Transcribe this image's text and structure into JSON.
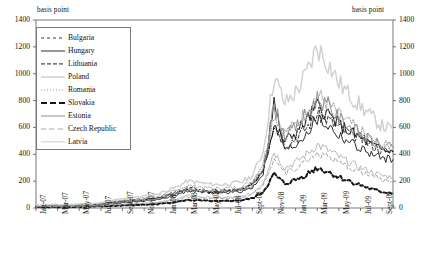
{
  "axis": {
    "unit_left": "basis point",
    "unit_right": "basis point",
    "y_ticks": [
      "1400",
      "1200",
      "1000",
      "800",
      "600",
      "400",
      "200",
      "0"
    ],
    "y_ticks_right": [
      "1400",
      "1200",
      "1000",
      "800",
      "600",
      "400",
      "200",
      "0"
    ],
    "x_ticks": [
      "Jan-07",
      "Mar-07",
      "May-07",
      "Jul-07",
      "Sept-07",
      "Nov-07",
      "Jan-08",
      "Mar-08",
      "May-08",
      "Jul-08",
      "Sept-08",
      "Nov-08",
      "Jan-09",
      "Mar-09",
      "May-09",
      "Jul-09",
      "Sept-09"
    ]
  },
  "legend": {
    "items": [
      {
        "label": "Bulgaria",
        "style": "dashed-long",
        "color": "#3a3a3a",
        "width": 1.0
      },
      {
        "label": "Hungary",
        "style": "solid",
        "color": "#2b2b2b",
        "width": 1.0
      },
      {
        "label": "Lithuania",
        "style": "dashdot",
        "color": "#1e1e1e",
        "width": 1.2
      },
      {
        "label": "Poland",
        "style": "solid",
        "color": "#b9b9b9",
        "width": 1.0
      },
      {
        "label": "Romania",
        "style": "dotted",
        "color": "#9a9a9a",
        "width": 1.0
      },
      {
        "label": "Slovakia",
        "style": "dashed-bold",
        "color": "#151515",
        "width": 2.0
      },
      {
        "label": "Estonia",
        "style": "solid",
        "color": "#8f8f8f",
        "width": 1.0
      },
      {
        "label": "Czech Republic",
        "style": "dashed-gray",
        "color": "#a8a8a8",
        "width": 1.0
      },
      {
        "label": "Latvia",
        "style": "solid",
        "color": "#cfcfcf",
        "width": 1.4
      }
    ]
  },
  "chart_data": {
    "type": "line",
    "title": "",
    "xlabel": "",
    "ylabel": "basis point",
    "ylim": [
      0,
      1400
    ],
    "grid": false,
    "legend_position": "top-left-inside",
    "x": [
      "Jan-07",
      "Feb-07",
      "Mar-07",
      "Apr-07",
      "May-07",
      "Jun-07",
      "Jul-07",
      "Aug-07",
      "Sept-07",
      "Oct-07",
      "Nov-07",
      "Dec-07",
      "Jan-08",
      "Feb-08",
      "Mar-08",
      "Apr-08",
      "May-08",
      "Jun-08",
      "Jul-08",
      "Aug-08",
      "Sept-08",
      "Oct-08",
      "Nov-08",
      "Dec-08",
      "Jan-09",
      "Feb-09",
      "Mar-09",
      "Apr-09",
      "May-09",
      "Jun-09",
      "Jul-09",
      "Aug-09",
      "Sept-09",
      "Oct-09"
    ],
    "series": [
      {
        "name": "Bulgaria",
        "values": [
          18,
          20,
          22,
          20,
          24,
          26,
          30,
          44,
          52,
          60,
          66,
          74,
          96,
          118,
          150,
          140,
          130,
          128,
          134,
          142,
          176,
          300,
          640,
          470,
          520,
          600,
          700,
          660,
          600,
          560,
          520,
          470,
          430,
          420
        ]
      },
      {
        "name": "Hungary",
        "values": [
          14,
          15,
          16,
          16,
          18,
          20,
          24,
          34,
          40,
          46,
          52,
          58,
          76,
          96,
          128,
          120,
          112,
          110,
          116,
          124,
          150,
          260,
          780,
          420,
          470,
          560,
          660,
          610,
          540,
          490,
          440,
          400,
          370,
          360
        ]
      },
      {
        "name": "Lithuania",
        "values": [
          16,
          17,
          18,
          18,
          20,
          22,
          26,
          38,
          46,
          54,
          60,
          68,
          88,
          110,
          140,
          132,
          124,
          122,
          128,
          136,
          168,
          290,
          600,
          500,
          560,
          650,
          760,
          700,
          620,
          570,
          520,
          470,
          430,
          420
        ]
      },
      {
        "name": "Poland",
        "values": [
          10,
          11,
          12,
          12,
          13,
          14,
          17,
          24,
          28,
          32,
          36,
          40,
          52,
          68,
          90,
          84,
          78,
          76,
          80,
          86,
          108,
          190,
          420,
          300,
          340,
          400,
          470,
          430,
          380,
          340,
          300,
          270,
          240,
          230
        ]
      },
      {
        "name": "Romania",
        "values": [
          20,
          21,
          23,
          22,
          26,
          28,
          33,
          48,
          58,
          66,
          74,
          82,
          108,
          130,
          168,
          158,
          148,
          144,
          150,
          160,
          200,
          340,
          700,
          560,
          620,
          720,
          840,
          780,
          690,
          630,
          570,
          510,
          470,
          460
        ]
      },
      {
        "name": "Slovakia",
        "values": [
          6,
          7,
          8,
          8,
          9,
          10,
          12,
          16,
          19,
          22,
          25,
          28,
          36,
          46,
          60,
          56,
          52,
          50,
          54,
          58,
          72,
          120,
          250,
          180,
          210,
          250,
          300,
          270,
          230,
          200,
          170,
          140,
          120,
          110
        ]
      },
      {
        "name": "Estonia",
        "values": [
          14,
          15,
          16,
          16,
          18,
          20,
          24,
          36,
          44,
          52,
          58,
          66,
          86,
          108,
          138,
          130,
          122,
          120,
          126,
          134,
          166,
          300,
          760,
          540,
          600,
          700,
          820,
          760,
          670,
          610,
          550,
          500,
          460,
          450
        ]
      },
      {
        "name": "Czech Republic",
        "values": [
          9,
          10,
          11,
          11,
          12,
          13,
          16,
          22,
          26,
          30,
          34,
          38,
          48,
          62,
          82,
          76,
          72,
          70,
          74,
          80,
          100,
          170,
          380,
          260,
          300,
          350,
          410,
          380,
          330,
          300,
          270,
          240,
          210,
          200
        ]
      },
      {
        "name": "Latvia",
        "values": [
          22,
          24,
          26,
          25,
          30,
          32,
          38,
          56,
          68,
          78,
          88,
          98,
          128,
          156,
          200,
          190,
          178,
          174,
          182,
          194,
          240,
          420,
          980,
          780,
          860,
          1000,
          1200,
          1080,
          930,
          840,
          760,
          680,
          610,
          580
        ]
      }
    ]
  }
}
